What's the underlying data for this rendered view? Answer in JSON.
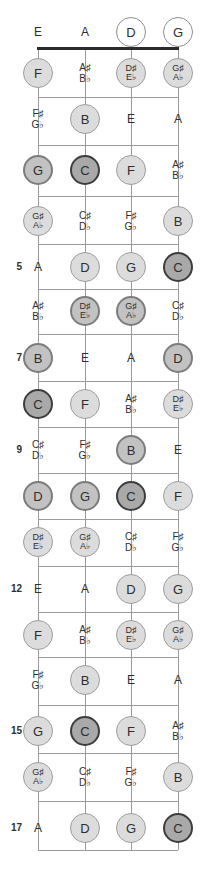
{
  "diagram": {
    "instrument": "bass-guitar",
    "strings": [
      "E",
      "A",
      "D",
      "G"
    ],
    "fret_numbers_shown": [
      "5",
      "7",
      "9",
      "12",
      "15",
      "17"
    ],
    "marker_styles": {
      "open_circle": "#ffffff",
      "light_circle": "#dcdcdc",
      "mid_circle": "#c2c2c2",
      "dark_circle": "#a9a9a9",
      "string_color": "#9a9a9a",
      "nut_color": "#2b2b2b",
      "text_color": "#2e2e2e"
    },
    "rows": [
      {
        "fret": "0",
        "fret_label": "",
        "notes": [
          {
            "l1": "E",
            "l2": "",
            "style": "plain"
          },
          {
            "l1": "A",
            "l2": "",
            "style": "plain"
          },
          {
            "l1": "D",
            "l2": "",
            "style": "open"
          },
          {
            "l1": "G",
            "l2": "",
            "style": "open"
          }
        ]
      },
      {
        "fret": "1",
        "fret_label": "",
        "notes": [
          {
            "l1": "F",
            "l2": "",
            "style": "light"
          },
          {
            "l1": "A♯",
            "l2": "B♭",
            "style": "plain"
          },
          {
            "l1": "D♯",
            "l2": "E♭",
            "style": "light"
          },
          {
            "l1": "G♯",
            "l2": "A♭",
            "style": "light"
          }
        ]
      },
      {
        "fret": "2",
        "fret_label": "",
        "notes": [
          {
            "l1": "F♯",
            "l2": "G♭",
            "style": "plain"
          },
          {
            "l1": "B",
            "l2": "",
            "style": "light"
          },
          {
            "l1": "E",
            "l2": "",
            "style": "plain"
          },
          {
            "l1": "A",
            "l2": "",
            "style": "plain"
          }
        ]
      },
      {
        "fret": "3",
        "fret_label": "",
        "notes": [
          {
            "l1": "G",
            "l2": "",
            "style": "mid"
          },
          {
            "l1": "C",
            "l2": "",
            "style": "dark"
          },
          {
            "l1": "F",
            "l2": "",
            "style": "light"
          },
          {
            "l1": "A♯",
            "l2": "B♭",
            "style": "plain"
          }
        ]
      },
      {
        "fret": "4",
        "fret_label": "",
        "notes": [
          {
            "l1": "G♯",
            "l2": "A♭",
            "style": "light"
          },
          {
            "l1": "C♯",
            "l2": "D♭",
            "style": "plain"
          },
          {
            "l1": "F♯",
            "l2": "G♭",
            "style": "plain"
          },
          {
            "l1": "B",
            "l2": "",
            "style": "light"
          }
        ]
      },
      {
        "fret": "5",
        "fret_label": "5",
        "notes": [
          {
            "l1": "A",
            "l2": "",
            "style": "plain"
          },
          {
            "l1": "D",
            "l2": "",
            "style": "light"
          },
          {
            "l1": "G",
            "l2": "",
            "style": "light"
          },
          {
            "l1": "C",
            "l2": "",
            "style": "dark"
          }
        ]
      },
      {
        "fret": "6",
        "fret_label": "",
        "notes": [
          {
            "l1": "A♯",
            "l2": "B♭",
            "style": "plain"
          },
          {
            "l1": "D♯",
            "l2": "E♭",
            "style": "mid"
          },
          {
            "l1": "G♯",
            "l2": "A♭",
            "style": "mid"
          },
          {
            "l1": "C♯",
            "l2": "D♭",
            "style": "plain"
          }
        ]
      },
      {
        "fret": "7",
        "fret_label": "7",
        "notes": [
          {
            "l1": "B",
            "l2": "",
            "style": "mid"
          },
          {
            "l1": "E",
            "l2": "",
            "style": "plain"
          },
          {
            "l1": "A",
            "l2": "",
            "style": "plain"
          },
          {
            "l1": "D",
            "l2": "",
            "style": "mid"
          }
        ]
      },
      {
        "fret": "8",
        "fret_label": "",
        "notes": [
          {
            "l1": "C",
            "l2": "",
            "style": "dark"
          },
          {
            "l1": "F",
            "l2": "",
            "style": "light"
          },
          {
            "l1": "A♯",
            "l2": "B♭",
            "style": "plain"
          },
          {
            "l1": "D♯",
            "l2": "E♭",
            "style": "light"
          }
        ]
      },
      {
        "fret": "9",
        "fret_label": "9",
        "notes": [
          {
            "l1": "C♯",
            "l2": "D♭",
            "style": "plain"
          },
          {
            "l1": "F♯",
            "l2": "G♭",
            "style": "plain"
          },
          {
            "l1": "B",
            "l2": "",
            "style": "mid"
          },
          {
            "l1": "E",
            "l2": "",
            "style": "plain"
          }
        ]
      },
      {
        "fret": "10",
        "fret_label": "",
        "notes": [
          {
            "l1": "D",
            "l2": "",
            "style": "mid"
          },
          {
            "l1": "G",
            "l2": "",
            "style": "mid"
          },
          {
            "l1": "C",
            "l2": "",
            "style": "dark"
          },
          {
            "l1": "F",
            "l2": "",
            "style": "light"
          }
        ]
      },
      {
        "fret": "11",
        "fret_label": "",
        "notes": [
          {
            "l1": "D♯",
            "l2": "E♭",
            "style": "light"
          },
          {
            "l1": "G♯",
            "l2": "A♭",
            "style": "light"
          },
          {
            "l1": "C♯",
            "l2": "D♭",
            "style": "plain"
          },
          {
            "l1": "F♯",
            "l2": "G♭",
            "style": "plain"
          }
        ]
      },
      {
        "fret": "12",
        "fret_label": "12",
        "notes": [
          {
            "l1": "E",
            "l2": "",
            "style": "plain"
          },
          {
            "l1": "A",
            "l2": "",
            "style": "plain"
          },
          {
            "l1": "D",
            "l2": "",
            "style": "light"
          },
          {
            "l1": "G",
            "l2": "",
            "style": "light"
          }
        ]
      },
      {
        "fret": "13",
        "fret_label": "",
        "notes": [
          {
            "l1": "F",
            "l2": "",
            "style": "light"
          },
          {
            "l1": "A♯",
            "l2": "B♭",
            "style": "plain"
          },
          {
            "l1": "D♯",
            "l2": "E♭",
            "style": "light"
          },
          {
            "l1": "G♯",
            "l2": "A♭",
            "style": "light"
          }
        ]
      },
      {
        "fret": "14",
        "fret_label": "",
        "notes": [
          {
            "l1": "F♯",
            "l2": "G♭",
            "style": "plain"
          },
          {
            "l1": "B",
            "l2": "",
            "style": "light"
          },
          {
            "l1": "E",
            "l2": "",
            "style": "plain"
          },
          {
            "l1": "A",
            "l2": "",
            "style": "plain"
          }
        ]
      },
      {
        "fret": "15",
        "fret_label": "15",
        "notes": [
          {
            "l1": "G",
            "l2": "",
            "style": "light"
          },
          {
            "l1": "C",
            "l2": "",
            "style": "dark"
          },
          {
            "l1": "F",
            "l2": "",
            "style": "light"
          },
          {
            "l1": "A♯",
            "l2": "B♭",
            "style": "plain"
          }
        ]
      },
      {
        "fret": "16",
        "fret_label": "",
        "notes": [
          {
            "l1": "G♯",
            "l2": "A♭",
            "style": "light"
          },
          {
            "l1": "C♯",
            "l2": "D♭",
            "style": "plain"
          },
          {
            "l1": "F♯",
            "l2": "G♭",
            "style": "plain"
          },
          {
            "l1": "B",
            "l2": "",
            "style": "light"
          }
        ]
      },
      {
        "fret": "17",
        "fret_label": "17",
        "notes": [
          {
            "l1": "A",
            "l2": "",
            "style": "plain"
          },
          {
            "l1": "D",
            "l2": "",
            "style": "light"
          },
          {
            "l1": "G",
            "l2": "",
            "style": "light"
          },
          {
            "l1": "C",
            "l2": "",
            "style": "dark"
          }
        ]
      }
    ]
  }
}
